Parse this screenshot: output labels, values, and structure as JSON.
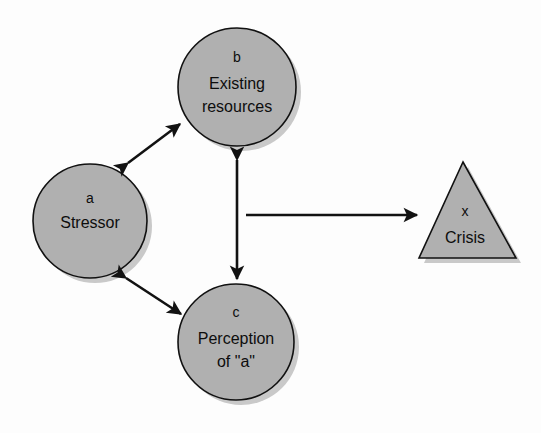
{
  "diagram": {
    "background_color": "#fdfdfd",
    "shape_fill_color": "#b0b0b0",
    "shape_stroke_color": "#111111",
    "shadow_color": "#c9c9c9",
    "text_color": "#0d0d0d",
    "arrow_color": "#121212",
    "nodes": [
      {
        "id": "a",
        "shape": "circle",
        "key": "a",
        "lines": [
          "Stressor"
        ],
        "cx": 90,
        "cy": 221,
        "r": 57
      },
      {
        "id": "b",
        "shape": "circle",
        "key": "b",
        "lines": [
          "Existing",
          "resources"
        ],
        "cx": 237,
        "cy": 87,
        "r": 59
      },
      {
        "id": "c",
        "shape": "circle",
        "key": "c",
        "lines": [
          "Perception",
          "of \"a\""
        ],
        "cx": 236,
        "cy": 342,
        "r": 58
      },
      {
        "id": "x",
        "shape": "triangle",
        "key": "x",
        "lines": [
          "Crisis"
        ],
        "apex_x": 463,
        "apex_y": 162,
        "base_left_x": 419,
        "base_right_x": 516,
        "base_y": 258
      }
    ],
    "edges": [
      {
        "id": "a-b",
        "from": "a",
        "to": "b",
        "style": "double-headed",
        "x1": 128,
        "y1": 163,
        "x2": 180,
        "y2": 124
      },
      {
        "id": "b-c",
        "from": "b",
        "to": "c",
        "style": "double-headed",
        "x1": 237,
        "y1": 160,
        "x2": 237,
        "y2": 279
      },
      {
        "id": "a-c",
        "from": "a",
        "to": "c",
        "style": "double-headed",
        "x1": 126,
        "y1": 278,
        "x2": 181,
        "y2": 314
      },
      {
        "id": "to-crisis",
        "from": "b-c-axis",
        "to": "x",
        "style": "single-headed",
        "x1": 246,
        "y1": 215,
        "x2": 417,
        "y2": 215
      }
    ]
  }
}
